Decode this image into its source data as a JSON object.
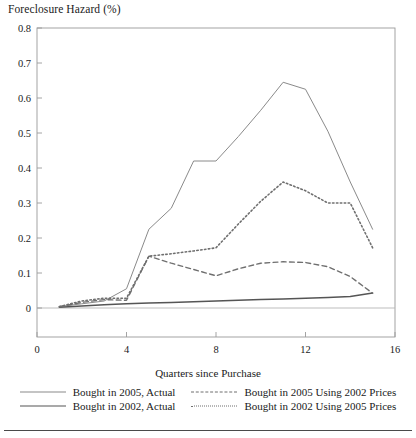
{
  "chart_data": {
    "type": "line",
    "title": "Foreclosure Hazard (%)",
    "xlabel": "Quarters since Purchase",
    "ylabel": "Foreclosure Hazard (%)",
    "xlim": [
      0,
      16
    ],
    "ylim": [
      0,
      0.8
    ],
    "xticks": [
      "0",
      "4",
      "8",
      "12",
      "16"
    ],
    "xtick_values": [
      0,
      4,
      8,
      12,
      16
    ],
    "yticks": [
      "0",
      "0.1",
      "0.2",
      "0.3",
      "0.4",
      "0.5",
      "0.6",
      "0.7",
      "0.8"
    ],
    "ytick_values": [
      0,
      0.1,
      0.2,
      0.3,
      0.4,
      0.5,
      0.6,
      0.7,
      0.8
    ],
    "grid": false,
    "legend_position": "below",
    "x": [
      1,
      2,
      3,
      4,
      5,
      6,
      7,
      8,
      9,
      10,
      11,
      12,
      13,
      14,
      15
    ],
    "series": [
      {
        "name": "Bought in 2005, Actual",
        "style": "solid",
        "color": "#8a8a8a",
        "width": 1.0,
        "values": [
          0.004,
          0.012,
          0.02,
          0.055,
          0.225,
          0.285,
          0.42,
          0.42,
          0.49,
          0.565,
          0.645,
          0.625,
          0.505,
          0.36,
          0.225
        ]
      },
      {
        "name": "Bought in 2002, Actual",
        "style": "solid",
        "color": "#555555",
        "width": 1.5,
        "values": [
          0.002,
          0.006,
          0.009,
          0.012,
          0.014,
          0.016,
          0.018,
          0.02,
          0.022,
          0.024,
          0.026,
          0.028,
          0.03,
          0.033,
          0.043
        ]
      },
      {
        "name": "Bought in 2005 Using 2002 Prices",
        "style": "dashed",
        "color": "#6f6f6f",
        "width": 1.4,
        "values": [
          0.004,
          0.016,
          0.024,
          0.022,
          0.148,
          0.128,
          0.11,
          0.092,
          0.112,
          0.128,
          0.132,
          0.13,
          0.118,
          0.09,
          0.042
        ]
      },
      {
        "name": "Bought in 2002 Using 2005 Prices",
        "style": "dotted",
        "color": "#6f6f6f",
        "width": 1.6,
        "values": [
          0.004,
          0.02,
          0.028,
          0.028,
          0.148,
          0.155,
          0.163,
          0.172,
          0.24,
          0.305,
          0.36,
          0.335,
          0.3,
          0.3,
          0.172
        ]
      }
    ]
  },
  "legend": {
    "items": [
      {
        "label": "Bought in 2005, Actual",
        "key": "solid-thin"
      },
      {
        "label": "Bought in 2005 Using 2002 Prices",
        "key": "dashed"
      },
      {
        "label": "Bought in 2002, Actual",
        "key": "solid-thick"
      },
      {
        "label": "Bought in 2002 Using 2005 Prices",
        "key": "dotted"
      }
    ]
  }
}
